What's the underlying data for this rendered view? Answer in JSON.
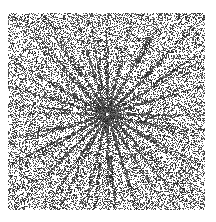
{
  "image": {
    "width": 216,
    "height": 222,
    "background_color": "#ffffff",
    "ink_color": "#1a1a1a",
    "description": "Scanned halftone print of a radial burst: dense random black dither on white with dark rays converging at a center point.",
    "rendering": "bitonal-dither",
    "has_text": false,
    "has_axes": false,
    "has_legend": false,
    "has_border": false
  },
  "field": {
    "left": 8,
    "top": 13,
    "right": 205,
    "bottom": 210,
    "width": 197,
    "height": 197,
    "margin_color": "#ffffff"
  },
  "center": {
    "x": 107,
    "y": 114,
    "label": "convergence-point"
  },
  "noise": {
    "type": "random-dither",
    "base_density": 0.42,
    "dot_size_px": 1,
    "edge_density": 0.4,
    "center_density": 0.34,
    "vignette_strength": 0.18,
    "seed": 20240617
  },
  "rays": {
    "count": 24,
    "angles_deg": [
      0,
      14,
      29,
      45,
      58,
      72,
      90,
      104,
      118,
      135,
      149,
      163,
      180,
      195,
      209,
      225,
      238,
      252,
      270,
      284,
      298,
      315,
      329,
      343
    ],
    "inner_radius": 3,
    "outer_radius": 150,
    "core_width_px": 3.1,
    "tip_width_px": 0.85,
    "core_opacity": 0.95,
    "tip_opacity": 0.18,
    "branching": true,
    "branch_count": 18,
    "branch_angle_spread_deg": 7
  },
  "chart_data": {
    "type": "scatter",
    "title": "",
    "subtitle": "",
    "xlabel": "",
    "ylabel": "",
    "grid": false,
    "legend": null,
    "xlim": [
      8,
      205
    ],
    "ylim": [
      13,
      210
    ],
    "annotations": [],
    "series": [
      {
        "name": "background-dither",
        "kind": "random-points",
        "color": "#1a1a1a",
        "point_count": 16800,
        "density": 0.42
      },
      {
        "name": "radial-rays",
        "kind": "rays-from-center",
        "color": "#141414",
        "origin": [
          107,
          114
        ],
        "count": 24,
        "angles_deg": [
          0,
          14,
          29,
          45,
          58,
          72,
          90,
          104,
          118,
          135,
          149,
          163,
          180,
          195,
          209,
          225,
          238,
          252,
          270,
          284,
          298,
          315,
          329,
          343
        ],
        "lengths": [
          118,
          122,
          130,
          138,
          128,
          124,
          116,
          126,
          134,
          140,
          130,
          120,
          112,
          124,
          132,
          141,
          129,
          122,
          118,
          127,
          136,
          139,
          128,
          121
        ]
      }
    ]
  }
}
